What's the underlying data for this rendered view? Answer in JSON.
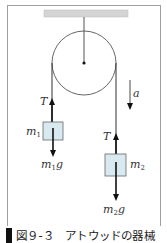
{
  "figure": {
    "caption_number": "図９-３",
    "caption_title": "アトウッドの器械",
    "caption": "図９-３　アトウッドの器械"
  },
  "labels": {
    "tension_left": "T",
    "tension_right": "T",
    "acceleration": "a",
    "mass_left": "m",
    "mass_left_sub": "1",
    "mass_right": "m",
    "mass_right_sub": "2",
    "weight_left": "m",
    "weight_left_sub": "1",
    "weight_left_g": "g",
    "weight_right": "m",
    "weight_right_sub": "2",
    "weight_right_g": "g"
  },
  "colors": {
    "frame": "#9a9a9a",
    "ceiling": "#d4d4d4",
    "block_fill": "#d8e9f0",
    "block_stroke": "#666666",
    "line": "#333333",
    "caption_bar": "#111111"
  }
}
